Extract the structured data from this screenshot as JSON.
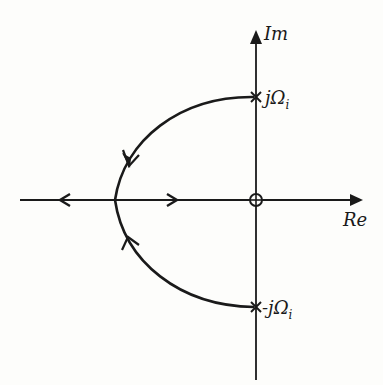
{
  "diagram": {
    "type": "root-locus",
    "axes": {
      "real_label": "Re",
      "imag_label": "Im"
    },
    "poles": [
      {
        "label": "jΩ",
        "subscript": "i",
        "position": "upper imaginary axis"
      },
      {
        "label": "-jΩ",
        "subscript": "i",
        "position": "lower imaginary axis"
      }
    ],
    "zeros": [
      {
        "label": "",
        "position": "origin"
      }
    ],
    "colors": {
      "ink": "#1a1a1a",
      "background": "#fdfdfb"
    }
  }
}
